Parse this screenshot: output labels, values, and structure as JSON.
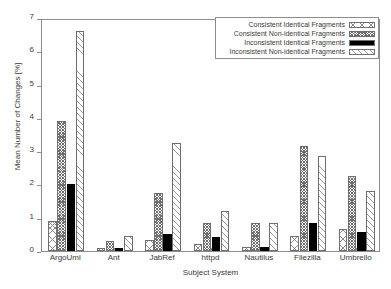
{
  "chart_data": {
    "type": "bar",
    "title": "",
    "xlabel": "Subject System",
    "ylabel": "Mean Number of Changes [%]",
    "ylim": [
      0,
      7
    ],
    "yticks": [
      0,
      1,
      2,
      3,
      4,
      5,
      6,
      7
    ],
    "grid": false,
    "legend_position": "top-right",
    "categories": [
      "ArgoUml",
      "Ant",
      "JabRef",
      "httpd",
      "Nautilus",
      "Filezilla",
      "Umbrello"
    ],
    "series": [
      {
        "name": "Consistent Identical Fragments",
        "pattern": "sparse-crosshatch",
        "values": [
          0.9,
          0.1,
          0.32,
          0.22,
          0.12,
          0.45,
          0.65
        ]
      },
      {
        "name": "Consistent Non-identical Fragments",
        "pattern": "dense-checker",
        "values": [
          3.92,
          0.3,
          1.75,
          0.85,
          0.85,
          3.15,
          2.25
        ]
      },
      {
        "name": "Inconsistent Identical Fragments",
        "pattern": "solid-black",
        "values": [
          2.0,
          0.1,
          0.52,
          0.43,
          0.13,
          0.85,
          0.57
        ]
      },
      {
        "name": "Inconsistent Non-identical Fragments",
        "pattern": "diagonal-hatch",
        "values": [
          6.6,
          0.45,
          3.25,
          1.2,
          0.85,
          2.85,
          1.8
        ]
      }
    ]
  },
  "axes": {
    "y_title": "Mean Number of Changes [%]",
    "x_title": "Subject System",
    "y_tick_labels": [
      "0",
      "1",
      "2",
      "3",
      "4",
      "5",
      "6",
      "7"
    ],
    "x_tick_labels": [
      "ArgoUml",
      "Ant",
      "JabRef",
      "httpd",
      "Nautilus",
      "Filezilla",
      "Umbrello"
    ]
  },
  "legend": {
    "items": [
      {
        "label": "Consistent Identical Fragments"
      },
      {
        "label": "Consistent Non-identical Fragments"
      },
      {
        "label": "Inconsistent Identical Fragments"
      },
      {
        "label": "Inconsistent Non-identical Fragments"
      }
    ]
  }
}
